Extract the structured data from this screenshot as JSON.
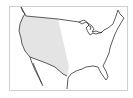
{
  "map": {
    "subject": "United States",
    "shaded_region": "Western United States",
    "colors": {
      "shade": "#e4e4e4",
      "outline": "#333333",
      "frame": "#cfcfcf",
      "background": "#ffffff"
    }
  }
}
